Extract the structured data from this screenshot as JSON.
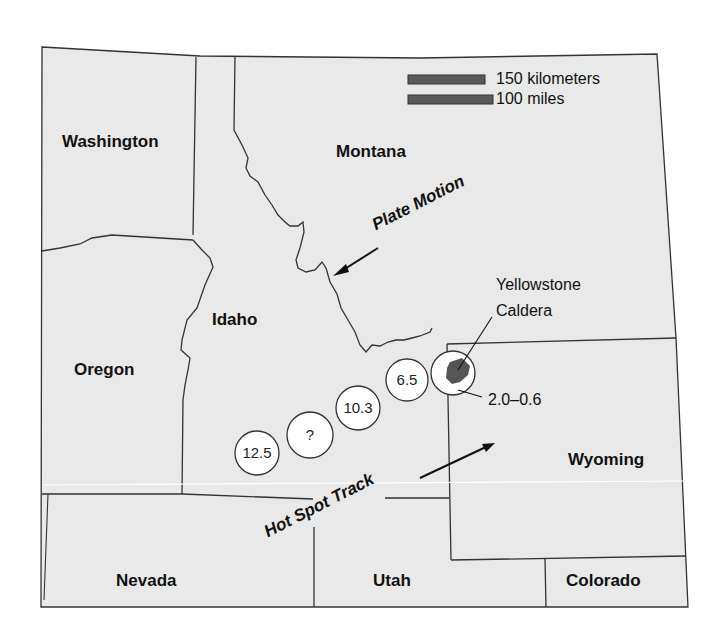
{
  "map": {
    "states": [
      {
        "name": "Washington",
        "x": 60,
        "y": 147
      },
      {
        "name": "Montana",
        "x": 335,
        "y": 158
      },
      {
        "name": "Idaho",
        "x": 212,
        "y": 348
      },
      {
        "name": "Oregon",
        "x": 73,
        "y": 397
      },
      {
        "name": "Wyoming",
        "x": 567,
        "y": 506
      },
      {
        "name": "Nevada",
        "x": 113,
        "y": 646
      },
      {
        "name": "Utah",
        "x": 373,
        "y": 646
      },
      {
        "name": "Colorado",
        "x": 567,
        "y": 646
      }
    ],
    "scale_bar": {
      "km_label": "150 kilometers",
      "mi_label": "100 miles",
      "bar_color": "#5a5a5a"
    },
    "annotations": {
      "plate_motion": "Plate Motion",
      "hot_spot_track": "Hot Spot Track",
      "yellowstone_line1": "Yellowstone",
      "yellowstone_line2": "Caldera",
      "yellowstone_age": "2.0–0.6"
    },
    "hotspot_circles": [
      {
        "label": "12.5",
        "cx": 257,
        "cy": 453
      },
      {
        "label": "?",
        "cx": 310,
        "cy": 435
      },
      {
        "label": "10.3",
        "cx": 358,
        "cy": 408
      },
      {
        "label": "6.5",
        "cx": 407,
        "cy": 380
      }
    ],
    "colors": {
      "land": "#e9e9e9",
      "border": "#333333",
      "caldera": "#555555",
      "circle_fill": "#ffffff"
    }
  }
}
